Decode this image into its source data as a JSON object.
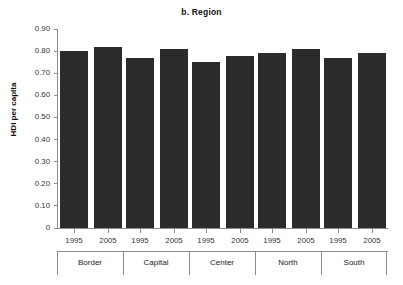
{
  "chart_data": {
    "type": "bar",
    "title": "b. Region",
    "xlabel": "",
    "ylabel": "HDI per capita",
    "ylim": [
      0,
      0.9
    ],
    "grid": false,
    "legend_position": "none",
    "categories": [
      "Border",
      "Capital",
      "Center",
      "North",
      "South"
    ],
    "subcategories": [
      "1995",
      "2005"
    ],
    "y_ticks": [
      "0",
      "0.10",
      "0.20",
      "0.30",
      "0.40",
      "0.50",
      "0.60",
      "0.70",
      "0.80",
      "0.90"
    ],
    "y_tick_values": [
      0,
      0.1,
      0.2,
      0.3,
      0.4,
      0.5,
      0.6,
      0.7,
      0.8,
      0.9
    ],
    "series": [
      {
        "name": "1995",
        "values": [
          0.8,
          0.77,
          0.75,
          0.79,
          0.77
        ]
      },
      {
        "name": "2005",
        "values": [
          0.82,
          0.81,
          0.78,
          0.81,
          0.79
        ]
      }
    ],
    "bars": [
      {
        "group": "Border",
        "year": "1995",
        "value": 0.8
      },
      {
        "group": "Border",
        "year": "2005",
        "value": 0.82
      },
      {
        "group": "Capital",
        "year": "1995",
        "value": 0.77
      },
      {
        "group": "Capital",
        "year": "2005",
        "value": 0.81
      },
      {
        "group": "Center",
        "year": "1995",
        "value": 0.75
      },
      {
        "group": "Center",
        "year": "2005",
        "value": 0.78
      },
      {
        "group": "North",
        "year": "1995",
        "value": 0.79
      },
      {
        "group": "North",
        "year": "2005",
        "value": 0.81
      },
      {
        "group": "South",
        "year": "1995",
        "value": 0.77
      },
      {
        "group": "South",
        "year": "2005",
        "value": 0.79
      }
    ],
    "colors": {
      "bar": "#2b2b2b",
      "axis": "#8c8c8c",
      "text": "#1a1a1a",
      "background": "#ffffff"
    }
  }
}
